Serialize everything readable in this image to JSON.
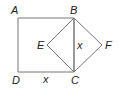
{
  "figure": {
    "points": {
      "A": {
        "label": "A",
        "x": 18,
        "y": 18
      },
      "B": {
        "label": "B",
        "x": 74,
        "y": 18
      },
      "C": {
        "label": "C",
        "x": 74,
        "y": 72
      },
      "D": {
        "label": "D",
        "x": 18,
        "y": 72
      },
      "E": {
        "label": "E",
        "x": 47,
        "y": 45
      },
      "F": {
        "label": "F",
        "x": 102,
        "y": 45
      }
    },
    "side_labels": {
      "DC": "x",
      "BC": "x"
    },
    "line_color": "#777777",
    "label_color": "#222222"
  }
}
